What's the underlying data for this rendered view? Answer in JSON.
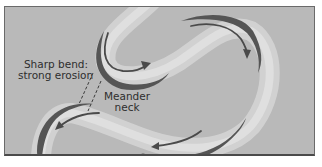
{
  "diagram": {
    "labels": {
      "sharp_bend_line1": "Sharp bend:",
      "sharp_bend_line2": "strong erosion",
      "meander_neck_line1": "Meander",
      "meander_neck_line2": "neck"
    },
    "colors": {
      "background": "#b9b9b9",
      "river": "#d6d6d6",
      "erosion_bank": "#555555",
      "flow_arrow": "#4a4a4a",
      "border": "#6a6a6a",
      "text": "#2e2e2e"
    },
    "elements": [
      {
        "name": "river-channel",
        "description": "light S-shaped river band with a tight meander loop"
      },
      {
        "name": "outer-bank-erosion",
        "description": "dark crescent bands on outer banks of bends"
      },
      {
        "name": "flow-arrows",
        "description": "dark arrows indicating downstream flow direction"
      },
      {
        "name": "meander-neck-lines",
        "description": "two dashed lines marking the narrow meander neck"
      }
    ]
  }
}
